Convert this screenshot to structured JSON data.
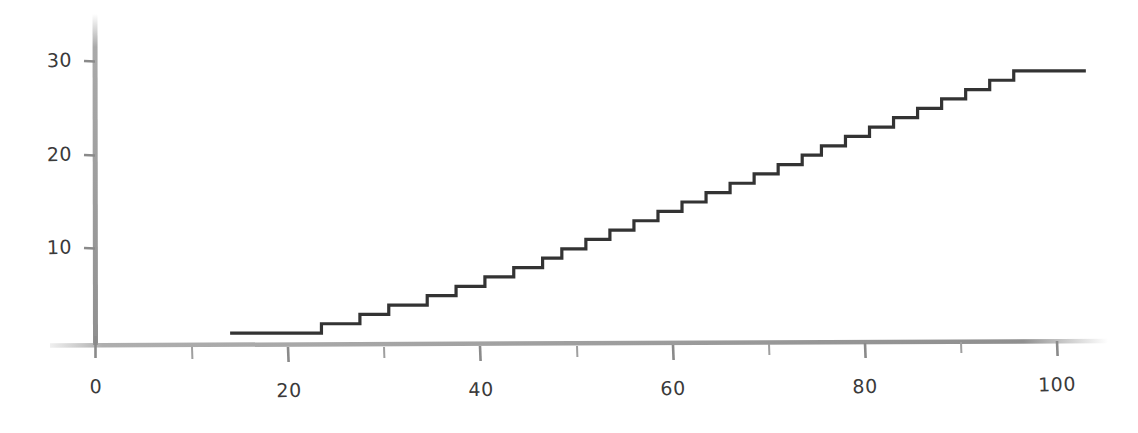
{
  "chart_data": {
    "type": "line",
    "subtype": "step",
    "title": "",
    "xlabel": "",
    "ylabel": "",
    "xlim": [
      0,
      104
    ],
    "ylim": [
      0,
      33
    ],
    "grid": false,
    "legend": null,
    "x_ticks": [
      0,
      20,
      40,
      60,
      80,
      100
    ],
    "x_tick_labels": [
      "0",
      "20",
      "40",
      "60",
      "80",
      "100"
    ],
    "x_minor_ticks": [
      10,
      30,
      50,
      70,
      90
    ],
    "y_ticks": [
      10,
      20,
      30
    ],
    "y_tick_labels": [
      "10",
      "20",
      "30"
    ],
    "y_minor_ticks": [],
    "series": [
      {
        "name": "step",
        "step_mode": "post",
        "x": [
          14,
          20.5,
          23.5,
          27.5,
          30.5,
          34.5,
          37.5,
          40.5,
          43.5,
          46.5,
          48.5,
          51,
          53.5,
          56,
          58.5,
          61,
          63.5,
          66,
          68.5,
          71,
          73.5,
          75.5,
          78,
          80.5,
          83,
          85.5,
          88,
          90.5,
          93,
          95.5,
          98,
          103
        ],
        "y": [
          1,
          1,
          2,
          3,
          4,
          5,
          6,
          7,
          8,
          9,
          10,
          11,
          12,
          13,
          14,
          15,
          16,
          17,
          18,
          19,
          20,
          21,
          22,
          23,
          24,
          25,
          26,
          27,
          28,
          29,
          29,
          29
        ]
      }
    ]
  },
  "style": {
    "axis_color": "#9a9a9a",
    "line_color": "#333333",
    "tick_label_color": "#3a3a3a",
    "background": "#ffffff"
  },
  "axis": {
    "x_axis_name": "x-axis",
    "y_axis_name": "y-axis"
  }
}
